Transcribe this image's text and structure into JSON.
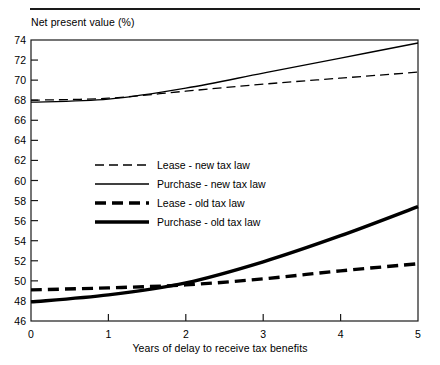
{
  "chart_data": {
    "type": "line",
    "title": "",
    "ylabel": "Net present value (%)",
    "xlabel": "Years of delay to receive tax benefits",
    "xlim": [
      0,
      5
    ],
    "ylim": [
      46,
      74
    ],
    "xticks": [
      "0",
      "1",
      "2",
      "3",
      "4",
      "5"
    ],
    "yticks": [
      "46",
      "48",
      "50",
      "52",
      "54",
      "56",
      "58",
      "60",
      "62",
      "64",
      "66",
      "68",
      "70",
      "72",
      "74"
    ],
    "grid": false,
    "legend_position": "center-left",
    "x": [
      0,
      1,
      2,
      3,
      4,
      5
    ],
    "series": [
      {
        "name": "Lease - new tax law",
        "style": "dashed",
        "width": "thin",
        "color": "#000000",
        "values": [
          68.0,
          68.2,
          68.9,
          69.6,
          70.2,
          70.8
        ]
      },
      {
        "name": "Purchase - new tax law",
        "style": "solid",
        "width": "thin",
        "color": "#000000",
        "values": [
          67.8,
          68.1,
          69.2,
          70.7,
          72.2,
          73.7
        ]
      },
      {
        "name": "Lease - old tax law",
        "style": "dashed",
        "width": "thick",
        "color": "#000000",
        "values": [
          49.1,
          49.3,
          49.6,
          50.2,
          51.0,
          51.7
        ]
      },
      {
        "name": "Purchase - old tax law",
        "style": "solid",
        "width": "thick",
        "color": "#000000",
        "values": [
          47.9,
          48.6,
          49.8,
          51.9,
          54.5,
          57.4
        ]
      }
    ]
  },
  "legend": {
    "items": [
      {
        "label": "Lease - new tax law"
      },
      {
        "label": "Purchase - new tax law"
      },
      {
        "label": "Lease - old tax law"
      },
      {
        "label": "Purchase - old tax law"
      }
    ]
  }
}
